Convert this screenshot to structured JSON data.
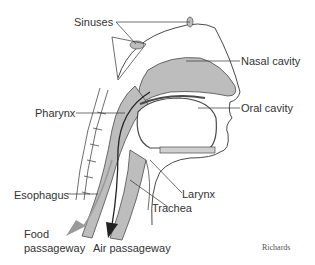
{
  "diagram": {
    "labels": {
      "sinuses": "Sinuses",
      "nasal_cavity": "Nasal cavity",
      "oral_cavity": "Oral cavity",
      "pharynx": "Pharynx",
      "esophagus": "Esophagus",
      "larynx": "Larynx",
      "trachea": "Trachea",
      "food_passageway_line1": "Food",
      "food_passageway_line2": "passageway",
      "air_passageway": "Air passageway"
    },
    "credit": "Richards",
    "colors": {
      "tissue_gray": "#bdbdbd",
      "outline": "#4a4a4a",
      "leader_line": "#333333",
      "food_arrow": "#9a9a9a",
      "air_arrow": "#222222"
    }
  }
}
